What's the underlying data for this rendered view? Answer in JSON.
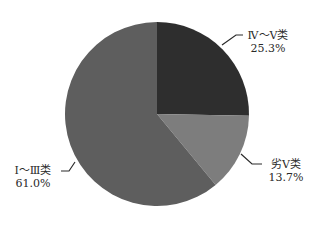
{
  "chart_data": {
    "type": "pie",
    "title": "",
    "slices": [
      {
        "label": "Ⅳ～Ⅴ类",
        "value": 25.3,
        "display": "25.3%",
        "color": "#2e2e2e"
      },
      {
        "label": "劣Ⅴ类",
        "value": 13.7,
        "display": "13.7%",
        "color": "#7d7d7d"
      },
      {
        "label": "Ⅰ～Ⅲ类",
        "value": 61.0,
        "display": "61.0%",
        "color": "#5e5e5e"
      }
    ],
    "start_angle": "12 o'clock",
    "direction": "clockwise",
    "legend": "none (leader-line labels)"
  }
}
